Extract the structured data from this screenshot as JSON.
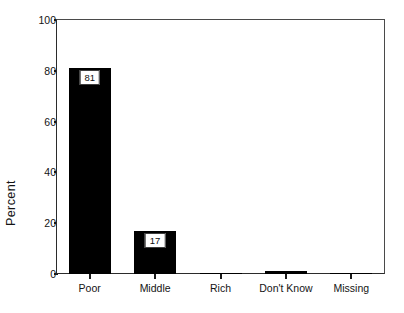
{
  "chart_data": {
    "type": "bar",
    "title": "",
    "subtitle": "",
    "xlabel": "",
    "ylabel": "Percent",
    "categories": [
      "Poor",
      "Middle",
      "Rich",
      "Don't Know",
      "Missing"
    ],
    "values": [
      81,
      17,
      0,
      1,
      0
    ],
    "value_labels": [
      "81",
      "17",
      "",
      "",
      ""
    ],
    "ylim": [
      0,
      100
    ],
    "y_ticks": [
      "0",
      "20",
      "40",
      "60",
      "80",
      "100"
    ],
    "y_tick_values": [
      0,
      20,
      40,
      60,
      80,
      100
    ],
    "grid": false,
    "legend": false,
    "legend_position": "none",
    "bar_color": "#000000",
    "frame_color": "#2b2b2b",
    "background_color": "#ffffff"
  },
  "axes": {
    "y_title": "Percent",
    "ticks_y": [
      {
        "label": "100",
        "value": 100
      },
      {
        "label": "80",
        "value": 80
      },
      {
        "label": "60",
        "value": 60
      },
      {
        "label": "40",
        "value": 40
      },
      {
        "label": "20",
        "value": 20
      },
      {
        "label": "0",
        "value": 0
      }
    ],
    "ticks_x": [
      {
        "label": "Poor",
        "value": 81,
        "value_label": "81"
      },
      {
        "label": "Middle",
        "value": 17,
        "value_label": "17"
      },
      {
        "label": "Rich",
        "value": 0,
        "value_label": ""
      },
      {
        "label": "Don't Know",
        "value": 1,
        "value_label": ""
      },
      {
        "label": "Missing",
        "value": 0,
        "value_label": ""
      }
    ]
  }
}
